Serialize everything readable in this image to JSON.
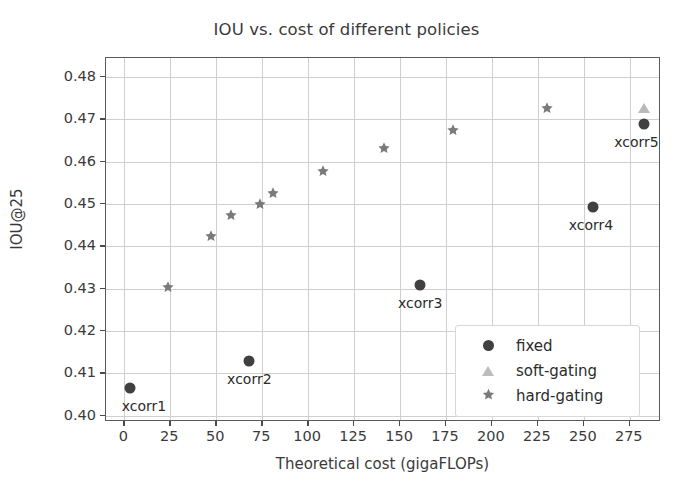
{
  "chart_data": {
    "type": "scatter",
    "title": "IOU vs. cost of different policies",
    "xlabel": "Theoretical cost (gigaFLOPs)",
    "ylabel": "IOU@25",
    "xlim": [
      -10,
      292
    ],
    "ylim": [
      0.3985,
      0.4845
    ],
    "xticks": [
      0,
      25,
      50,
      75,
      100,
      125,
      150,
      175,
      200,
      225,
      250,
      275
    ],
    "yticks": [
      0.4,
      0.41,
      0.42,
      0.43,
      0.44,
      0.45,
      0.46,
      0.47,
      0.48
    ],
    "xticklabels": [
      "0",
      "25",
      "50",
      "75",
      "100",
      "125",
      "150",
      "175",
      "200",
      "225",
      "250",
      "275"
    ],
    "yticklabels": [
      "0.40",
      "0.41",
      "0.42",
      "0.43",
      "0.44",
      "0.45",
      "0.46",
      "0.47",
      "0.48"
    ],
    "grid": true,
    "legend_position": "lower right",
    "series": [
      {
        "name": "fixed",
        "marker": "circle",
        "color": "#404040",
        "points": [
          {
            "x": 3,
            "y": 0.4065,
            "label": "xcorr1",
            "label_dx": 14,
            "label_dy": 10
          },
          {
            "x": 68,
            "y": 0.4128,
            "label": "xcorr2",
            "label_dx": 0,
            "label_dy": 10
          },
          {
            "x": 161,
            "y": 0.4308,
            "label": "xcorr3",
            "label_dx": 0,
            "label_dy": 10
          },
          {
            "x": 255,
            "y": 0.4494,
            "label": "xcorr4",
            "label_dx": -2,
            "label_dy": 10
          },
          {
            "x": 283,
            "y": 0.469,
            "label": "xcorr5",
            "label_dx": -8,
            "label_dy": 10
          }
        ]
      },
      {
        "name": "soft-gating",
        "marker": "triangle",
        "color": "#bdbdbd",
        "points": [
          {
            "x": 283,
            "y": 0.4728,
            "label": "",
            "label_dx": 0,
            "label_dy": 0
          }
        ]
      },
      {
        "name": "hard-gating",
        "marker": "star",
        "color": "#7a7a7a",
        "points": [
          {
            "x": 24,
            "y": 0.4305,
            "label": "",
            "label_dx": 0,
            "label_dy": 0
          },
          {
            "x": 47,
            "y": 0.4425,
            "label": "",
            "label_dx": 0,
            "label_dy": 0
          },
          {
            "x": 58,
            "y": 0.4475,
            "label": "",
            "label_dx": 0,
            "label_dy": 0
          },
          {
            "x": 74,
            "y": 0.45,
            "label": "",
            "label_dx": 0,
            "label_dy": 0
          },
          {
            "x": 81,
            "y": 0.4525,
            "label": "",
            "label_dx": 0,
            "label_dy": 0
          },
          {
            "x": 108,
            "y": 0.4578,
            "label": "",
            "label_dx": 0,
            "label_dy": 0
          },
          {
            "x": 141,
            "y": 0.4632,
            "label": "",
            "label_dx": 0,
            "label_dy": 0
          },
          {
            "x": 179,
            "y": 0.4675,
            "label": "",
            "label_dx": 0,
            "label_dy": 0
          },
          {
            "x": 230,
            "y": 0.4728,
            "label": "",
            "label_dx": 0,
            "label_dy": 0
          }
        ]
      }
    ],
    "legend_entries": [
      {
        "label": "fixed",
        "marker": "circle"
      },
      {
        "label": "soft-gating",
        "marker": "triangle"
      },
      {
        "label": "hard-gating",
        "marker": "star"
      }
    ]
  }
}
